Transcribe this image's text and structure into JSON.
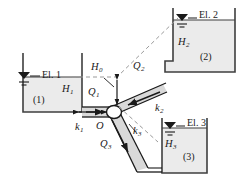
{
  "figure": {
    "colors": {
      "water_fill": "#ebebeb",
      "wall": "#3f3f3f",
      "pipe_fill": "#d9d9d9",
      "dash": "#8c8c8c",
      "text": "#1a1a1a"
    }
  },
  "reservoirs": [
    {
      "id": "reservoir-1",
      "elevation_label": "El. 1",
      "head_label": "H",
      "head_sub": "0",
      "number_label": "(1)"
    },
    {
      "id": "reservoir-2",
      "elevation_label": "El. 2",
      "head_label": "H",
      "head_sub": "2",
      "number_label": "(2)"
    },
    {
      "id": "reservoir-3",
      "elevation_label": "El. 3",
      "head_label": "H",
      "head_sub": "3",
      "number_label": "(3)"
    }
  ],
  "labels": {
    "el1": "El. 1",
    "el2": "El. 2",
    "el3": "El. 3",
    "res1": "(1)",
    "res2": "(2)",
    "res3": "(3)",
    "h0": "H",
    "h0_sub": "0",
    "h1": "H",
    "h1_sub": "1",
    "h2": "H",
    "h2_sub": "2",
    "h3": "H",
    "h3_sub": "3",
    "q1": "Q",
    "q1_sub": "1",
    "q2": "Q",
    "q2_sub": "2",
    "q3": "Q",
    "q3_sub": "3",
    "k1": "k",
    "k1_sub": "1",
    "k2": "k",
    "k2_sub": "2",
    "k3": "k",
    "k3_sub": "3",
    "junction": "O"
  }
}
